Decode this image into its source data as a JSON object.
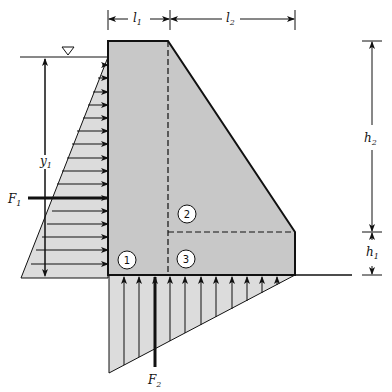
{
  "diagram": {
    "type": "gravity-dam-free-body",
    "colors": {
      "dam_fill": "#c8c8c8",
      "pressure_fill": "#dcdcdc",
      "stroke": "#111111",
      "background": "#ffffff"
    },
    "water_surface_symbol": "inverted-triangle",
    "dimensions": {
      "l1": {
        "base": "l",
        "sub": "1"
      },
      "l2": {
        "base": "l",
        "sub": "2"
      },
      "h1": {
        "base": "h",
        "sub": "1"
      },
      "h2": {
        "base": "h",
        "sub": "2"
      },
      "y1": {
        "base": "y",
        "sub": "1"
      }
    },
    "forces": {
      "F1": {
        "base": "F",
        "sub": "1",
        "direction": "horizontal-right"
      },
      "F2": {
        "base": "F",
        "sub": "2",
        "direction": "vertical-up"
      }
    },
    "regions": [
      "1",
      "2",
      "3"
    ]
  }
}
